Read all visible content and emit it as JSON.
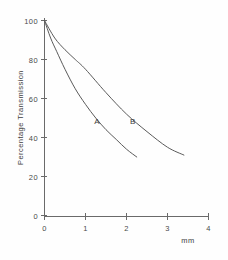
{
  "chart_data": {
    "type": "line",
    "title": "",
    "xlabel": "mm",
    "ylabel": "Percentage  Transmission",
    "xlim": [
      0,
      4
    ],
    "ylim": [
      0,
      100
    ],
    "grid": false,
    "legend_position": "inline-annotation",
    "xticks": [
      "0",
      "1",
      "2",
      "3",
      "4"
    ],
    "yticks": [
      "0",
      "20",
      "40",
      "60",
      "80",
      "100"
    ],
    "xtick_values": [
      0,
      1,
      2,
      3,
      4
    ],
    "ytick_values": [
      0,
      20,
      40,
      60,
      80,
      100
    ],
    "series": [
      {
        "name": "A",
        "label": "A",
        "annotation_x": 1.28,
        "annotation_y": 47,
        "x": [
          0,
          0.15,
          0.3,
          0.5,
          0.75,
          1.0,
          1.25,
          1.5,
          1.75,
          2.0,
          2.25
        ],
        "y": [
          100,
          91,
          84,
          75,
          65,
          57,
          50,
          44,
          39,
          34,
          30
        ]
      },
      {
        "name": "B",
        "label": "B",
        "annotation_x": 2.15,
        "annotation_y": 47,
        "x": [
          0,
          0.25,
          0.5,
          0.75,
          1.0,
          1.5,
          2.0,
          2.5,
          3.0,
          3.4
        ],
        "y": [
          100,
          91,
          85,
          80,
          75,
          63,
          52,
          43,
          35,
          31
        ]
      }
    ]
  },
  "axes": {
    "y_axis_label": "Percentage  Transmission",
    "x_unit_label": "mm",
    "origin_label": "0"
  },
  "colors": {
    "background": "#fefefe",
    "axis": "#6a6a6a",
    "curve": "#5a5a5a",
    "text": "#3d3d3d"
  }
}
